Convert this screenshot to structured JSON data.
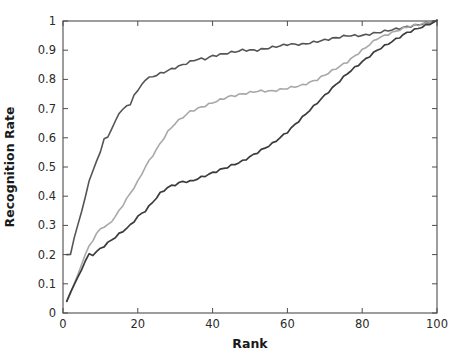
{
  "chart_data": {
    "type": "line",
    "title": "",
    "subtitle": "",
    "xlabel": "Rank",
    "ylabel": "Recognition Rate",
    "xlim": [
      0,
      100
    ],
    "ylim": [
      0,
      1
    ],
    "xticks": [
      0,
      20,
      40,
      60,
      80,
      100
    ],
    "xtick_labels": [
      "0",
      "20",
      "40",
      "60",
      "80",
      "100"
    ],
    "yticks": [
      0,
      0.1,
      0.2,
      0.3,
      0.4,
      0.5,
      0.6,
      0.7,
      0.8,
      0.9,
      1
    ],
    "ytick_labels": [
      "0",
      "0.1",
      "0.2",
      "0.3",
      "0.4",
      "0.5",
      "0.6",
      "0.7",
      "0.8",
      "0.9",
      "1"
    ],
    "grid": false,
    "legend": "none",
    "box": true,
    "tick_direction": "in",
    "background_color": "#ffffff",
    "axis_color": "#4d4d4d",
    "series": [
      {
        "name": "curve-upper",
        "color": "#555555",
        "line_width": 1.6,
        "x": [
          1,
          2,
          3,
          4,
          5,
          6,
          7,
          8,
          9,
          10,
          11,
          12,
          13,
          14,
          15,
          16,
          17,
          18,
          19,
          20,
          22,
          24,
          26,
          28,
          30,
          32,
          34,
          36,
          38,
          40,
          44,
          48,
          52,
          56,
          60,
          64,
          68,
          72,
          76,
          80,
          84,
          88,
          92,
          96,
          100
        ],
        "y": [
          0.2,
          0.2,
          0.26,
          0.3,
          0.35,
          0.4,
          0.45,
          0.49,
          0.52,
          0.55,
          0.6,
          0.6,
          0.63,
          0.66,
          0.68,
          0.7,
          0.71,
          0.71,
          0.75,
          0.76,
          0.8,
          0.81,
          0.82,
          0.83,
          0.84,
          0.85,
          0.86,
          0.87,
          0.87,
          0.88,
          0.89,
          0.9,
          0.9,
          0.91,
          0.92,
          0.92,
          0.93,
          0.94,
          0.95,
          0.95,
          0.96,
          0.97,
          0.98,
          0.99,
          1.0
        ]
      },
      {
        "name": "curve-middle",
        "color": "#a8a8a8",
        "line_width": 1.6,
        "x": [
          1,
          2,
          3,
          4,
          5,
          6,
          7,
          8,
          9,
          10,
          12,
          14,
          16,
          18,
          20,
          22,
          24,
          26,
          28,
          30,
          32,
          34,
          36,
          38,
          40,
          44,
          48,
          52,
          56,
          60,
          64,
          68,
          72,
          76,
          80,
          84,
          88,
          92,
          96,
          100
        ],
        "y": [
          0.04,
          0.07,
          0.1,
          0.13,
          0.17,
          0.2,
          0.23,
          0.25,
          0.27,
          0.29,
          0.3,
          0.33,
          0.37,
          0.41,
          0.45,
          0.5,
          0.54,
          0.58,
          0.62,
          0.65,
          0.67,
          0.69,
          0.7,
          0.71,
          0.72,
          0.74,
          0.75,
          0.76,
          0.76,
          0.77,
          0.78,
          0.8,
          0.83,
          0.86,
          0.9,
          0.94,
          0.96,
          0.98,
          0.99,
          1.0
        ]
      },
      {
        "name": "curve-lower",
        "color": "#3c3c3c",
        "line_width": 1.7,
        "x": [
          1,
          2,
          3,
          4,
          5,
          6,
          7,
          8,
          9,
          10,
          12,
          14,
          16,
          18,
          20,
          22,
          24,
          26,
          28,
          30,
          32,
          34,
          36,
          38,
          40,
          44,
          48,
          52,
          56,
          60,
          64,
          68,
          72,
          76,
          80,
          84,
          88,
          92,
          96,
          100
        ],
        "y": [
          0.04,
          0.07,
          0.1,
          0.12,
          0.15,
          0.18,
          0.2,
          0.2,
          0.21,
          0.22,
          0.24,
          0.26,
          0.28,
          0.3,
          0.33,
          0.35,
          0.38,
          0.41,
          0.43,
          0.44,
          0.45,
          0.45,
          0.46,
          0.47,
          0.48,
          0.5,
          0.52,
          0.55,
          0.58,
          0.62,
          0.67,
          0.72,
          0.77,
          0.82,
          0.86,
          0.9,
          0.93,
          0.96,
          0.98,
          1.0
        ]
      }
    ]
  },
  "plot": {
    "left": 63,
    "right": 437,
    "top": 21,
    "bottom": 313
  }
}
